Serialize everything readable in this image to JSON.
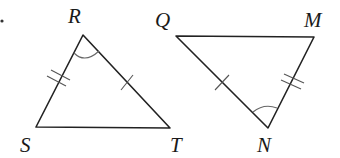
{
  "diagram": {
    "type": "congruent-triangles",
    "stray_mark": {
      "x": 2,
      "y": 21
    },
    "triangles": [
      {
        "name": "triangle-RST",
        "vertices": {
          "R": {
            "x": 83,
            "y": 35
          },
          "S": {
            "x": 36,
            "y": 127
          },
          "T": {
            "x": 170,
            "y": 128
          }
        },
        "labels": [
          {
            "text": "R",
            "x": 68,
            "y": 23
          },
          {
            "text": "S",
            "x": 20,
            "y": 152
          },
          {
            "text": "T",
            "x": 170,
            "y": 152
          }
        ],
        "markings": {
          "RS": "double-tick",
          "RT": "single-tick",
          "angle_R": "arc"
        }
      },
      {
        "name": "triangle-QMN",
        "vertices": {
          "Q": {
            "x": 176,
            "y": 36
          },
          "M": {
            "x": 314,
            "y": 37
          },
          "N": {
            "x": 268,
            "y": 128
          }
        },
        "labels": [
          {
            "text": "Q",
            "x": 155,
            "y": 27
          },
          {
            "text": "M",
            "x": 304,
            "y": 27
          },
          {
            "text": "N",
            "x": 257,
            "y": 152
          }
        ],
        "markings": {
          "QN": "single-tick",
          "MN": "double-tick",
          "angle_N": "arc"
        }
      }
    ],
    "colors": {
      "line": "#222222",
      "tick": "#555555",
      "label": "#1a1a1a"
    }
  }
}
